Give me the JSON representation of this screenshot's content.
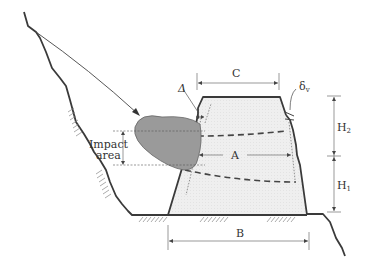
{
  "diagram": {
    "labels": {
      "C": "C",
      "delta": "Δ",
      "delta_v_main": "δ",
      "delta_v_sub": "v",
      "H2_main": "H",
      "H2_sub": "2",
      "H1_main": "H",
      "H1_sub": "1",
      "A": "A",
      "B": "B",
      "impact_line1": "Impact",
      "impact_line2": "area"
    },
    "colors": {
      "ground_line": "#3a3a3a",
      "embankment_fill": "#ececec",
      "embankment_outline": "#3a3a3a",
      "impact_blob": "#9a9a9a",
      "dimension_line": "#555555",
      "dashed_line": "#444444",
      "hatch": "#777777"
    }
  }
}
